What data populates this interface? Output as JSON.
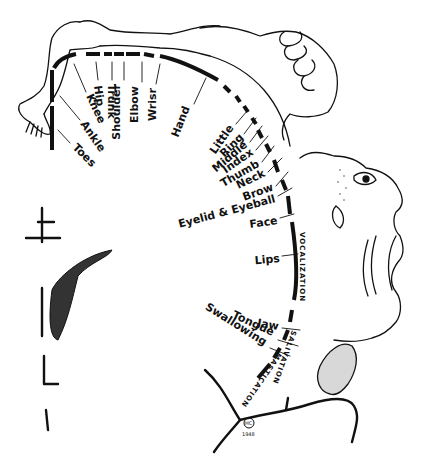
{
  "figure": {
    "type": "motor homunculus (Penfield) — cortical representation along precentral gyrus",
    "ink_color": "#111111",
    "background": "#ffffff"
  },
  "labels": {
    "toes": "Toes",
    "ankle": "Ankle",
    "knee": "Knee",
    "hip": "Hip",
    "trunk": "Trunk",
    "shoulder": "Shoulder",
    "elbow": "Elbow",
    "wrist": "Wrisr",
    "hand": "Hand",
    "little": "Little",
    "ring": "Ring",
    "middle": "Middle",
    "index": "Index",
    "thumb": "Thumb",
    "neck": "Neck",
    "brow": "Brow",
    "eyelid": "Eyelid & Eyeball",
    "face": "Face",
    "lips": "Lips",
    "jaw": "Jaw",
    "tongue": "Tongue",
    "swallowing": "Swallowing"
  },
  "arc_labels": {
    "vocalization": "VOCALIZATION",
    "salivation": "SALIVATION",
    "mastication": "MASTICATION"
  },
  "signature": {
    "monogram": "HC",
    "year": "1948"
  }
}
